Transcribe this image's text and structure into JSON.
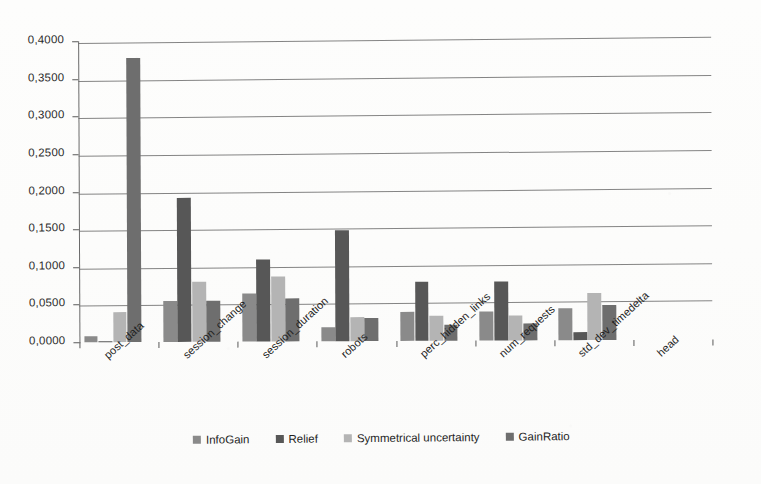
{
  "chart_data": {
    "type": "bar",
    "title": "",
    "xlabel": "",
    "ylabel": "",
    "ylim": [
      0.0,
      0.4
    ],
    "ytick_step": 0.05,
    "ytick_labels": [
      "0,0000",
      "0,0500",
      "0,1000",
      "0,1500",
      "0,2000",
      "0,2500",
      "0,3000",
      "0,3500",
      "0,4000"
    ],
    "ytick_values": [
      0.0,
      0.05,
      0.1,
      0.15,
      0.2,
      0.25,
      0.3,
      0.35,
      0.4
    ],
    "grid": true,
    "grid_axis": "y",
    "legend_position": "bottom",
    "decimal_separator": ",",
    "categories": [
      "post_data",
      "session_change",
      "session_duration",
      "robots",
      "perc_hidden_links",
      "num_requests",
      "std_dev_timedelta",
      "head"
    ],
    "series": [
      {
        "name": "InfoGain",
        "color": "#8a8a8a",
        "values": [
          0.008,
          0.054,
          0.064,
          0.018,
          0.038,
          0.038,
          0.042,
          0.0
        ]
      },
      {
        "name": "Relief",
        "color": "#575757",
        "values": [
          0.001,
          0.191,
          0.109,
          0.148,
          0.078,
          0.078,
          0.01,
          0.0
        ]
      },
      {
        "name": "Symmetrical uncertainty",
        "color": "#b4b4b4",
        "values": [
          0.0405,
          0.08,
          0.086,
          0.032,
          0.0335,
          0.0335,
          0.062,
          0.0
        ]
      },
      {
        "name": "GainRatio",
        "color": "#6e6e6e",
        "values": [
          0.378,
          0.0545,
          0.0575,
          0.03,
          0.0215,
          0.022,
          0.046,
          0.0
        ]
      }
    ]
  },
  "legend": {
    "items": [
      {
        "label": "InfoGain",
        "color": "#8a8a8a"
      },
      {
        "label": "Relief",
        "color": "#575757"
      },
      {
        "label": "Symmetrical uncertainty",
        "color": "#b4b4b4"
      },
      {
        "label": "GainRatio",
        "color": "#6e6e6e"
      }
    ]
  },
  "axes": {
    "y_axis_color": "#6a6a6a",
    "grid_color": "#6f6f6f"
  }
}
